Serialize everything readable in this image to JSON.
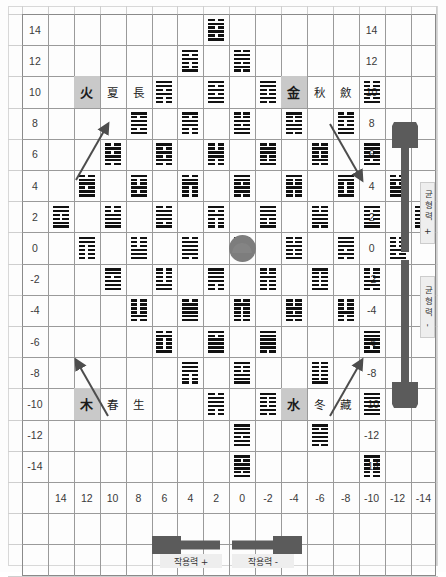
{
  "meta": {
    "center_symbol": "taiji-circle"
  },
  "axes": {
    "y_labels_left": [
      "14",
      "12",
      "10",
      "8",
      "6",
      "4",
      "2",
      "0",
      "-2",
      "-4",
      "-6",
      "-8",
      "-10",
      "-12",
      "-14"
    ],
    "y_labels_right": [
      "14",
      "12",
      "10",
      "8",
      "6",
      "4",
      "2",
      "0",
      "-2",
      "-4",
      "-6",
      "-8",
      "-10",
      "-12",
      "-14"
    ],
    "x_labels": [
      "14",
      "12",
      "10",
      "8",
      "6",
      "4",
      "2",
      "0",
      "-2",
      "-4",
      "-6",
      "-8",
      "-10",
      "-12",
      "-14"
    ],
    "x_axis_title_positive": "작용력 +",
    "x_axis_title_negative": "작용력 -",
    "y_axis_title_positive": "균형력 +",
    "y_axis_title_negative": "균형력 -"
  },
  "elements": [
    {
      "id": "fire",
      "element": "火",
      "season": "夏",
      "phase": "長",
      "row": 2,
      "col": 1,
      "y": 10,
      "x": 12
    },
    {
      "id": "metal",
      "element": "金",
      "season": "秋",
      "phase": "斂",
      "row": 2,
      "col": 9,
      "y": 10,
      "x": -4
    },
    {
      "id": "wood",
      "element": "木",
      "season": "春",
      "phase": "生",
      "row": 12,
      "col": 1,
      "y": -10,
      "x": 12
    },
    {
      "id": "water",
      "element": "水",
      "season": "冬",
      "phase": "藏",
      "row": 12,
      "col": 9,
      "y": -10,
      "x": -4
    }
  ],
  "arrows": {
    "upper_left": {
      "name": "arrow-up-right",
      "label": ""
    },
    "upper_right": {
      "name": "arrow-down-right",
      "label": ""
    },
    "lower_left": {
      "name": "arrow-up-left",
      "label": ""
    },
    "lower_right": {
      "name": "arrow-up-right",
      "label": ""
    }
  },
  "hexagrams": [
    {
      "row": 0,
      "col": 6,
      "lines": "101010"
    },
    {
      "row": 1,
      "col": 5,
      "lines": "100101"
    },
    {
      "row": 1,
      "col": 7,
      "lines": "010110"
    },
    {
      "row": 2,
      "col": 4,
      "lines": "001011"
    },
    {
      "row": 2,
      "col": 6,
      "lines": "110101"
    },
    {
      "row": 2,
      "col": 8,
      "lines": "010011"
    },
    {
      "row": 2,
      "col": 12,
      "lines": "101100"
    },
    {
      "row": 3,
      "col": 3,
      "lines": "101101"
    },
    {
      "row": 3,
      "col": 5,
      "lines": "001101"
    },
    {
      "row": 3,
      "col": 7,
      "lines": "110100"
    },
    {
      "row": 3,
      "col": 9,
      "lines": "011001"
    },
    {
      "row": 3,
      "col": 11,
      "lines": "110010"
    },
    {
      "row": 4,
      "col": 2,
      "lines": "011010"
    },
    {
      "row": 4,
      "col": 4,
      "lines": "010101"
    },
    {
      "row": 4,
      "col": 6,
      "lines": "001100"
    },
    {
      "row": 4,
      "col": 8,
      "lines": "100110"
    },
    {
      "row": 4,
      "col": 10,
      "lines": "010010"
    },
    {
      "row": 4,
      "col": 12,
      "lines": "101011"
    },
    {
      "row": 5,
      "col": 1,
      "lines": "110110"
    },
    {
      "row": 5,
      "col": 3,
      "lines": "101001"
    },
    {
      "row": 5,
      "col": 5,
      "lines": "000110"
    },
    {
      "row": 5,
      "col": 7,
      "lines": "011011"
    },
    {
      "row": 5,
      "col": 9,
      "lines": "001001"
    },
    {
      "row": 5,
      "col": 11,
      "lines": "100011"
    },
    {
      "row": 5,
      "col": 13,
      "lines": "111010"
    },
    {
      "row": 6,
      "col": 0,
      "lines": "110011"
    },
    {
      "row": 6,
      "col": 2,
      "lines": "111100"
    },
    {
      "row": 6,
      "col": 4,
      "lines": "101110"
    },
    {
      "row": 6,
      "col": 6,
      "lines": "000101"
    },
    {
      "row": 6,
      "col": 8,
      "lines": "100111"
    },
    {
      "row": 6,
      "col": 10,
      "lines": "011100"
    },
    {
      "row": 6,
      "col": 12,
      "lines": "110001"
    },
    {
      "row": 6,
      "col": 14,
      "lines": "001010"
    },
    {
      "row": 7,
      "col": 1,
      "lines": "000011"
    },
    {
      "row": 7,
      "col": 3,
      "lines": "111000"
    },
    {
      "row": 7,
      "col": 5,
      "lines": "011110"
    },
    {
      "row": 7,
      "col": 7,
      "lines": "000000"
    },
    {
      "row": 7,
      "col": 9,
      "lines": "100100"
    },
    {
      "row": 7,
      "col": 11,
      "lines": "010111"
    },
    {
      "row": 7,
      "col": 13,
      "lines": "101000"
    },
    {
      "row": 8,
      "col": 2,
      "lines": "111011"
    },
    {
      "row": 8,
      "col": 4,
      "lines": "110000"
    },
    {
      "row": 8,
      "col": 6,
      "lines": "001111"
    },
    {
      "row": 8,
      "col": 8,
      "lines": "000100"
    },
    {
      "row": 8,
      "col": 10,
      "lines": "100001"
    },
    {
      "row": 8,
      "col": 12,
      "lines": "011000"
    },
    {
      "row": 9,
      "col": 3,
      "lines": "010000"
    },
    {
      "row": 9,
      "col": 5,
      "lines": "111110"
    },
    {
      "row": 9,
      "col": 7,
      "lines": "000010"
    },
    {
      "row": 9,
      "col": 9,
      "lines": "010100"
    },
    {
      "row": 9,
      "col": 11,
      "lines": "001000"
    },
    {
      "row": 10,
      "col": 4,
      "lines": "100010"
    },
    {
      "row": 10,
      "col": 6,
      "lines": "111101"
    },
    {
      "row": 10,
      "col": 8,
      "lines": "011111"
    },
    {
      "row": 10,
      "col": 12,
      "lines": "101111"
    },
    {
      "row": 11,
      "col": 5,
      "lines": "000111"
    },
    {
      "row": 11,
      "col": 7,
      "lines": "111001"
    },
    {
      "row": 11,
      "col": 10,
      "lines": "100000"
    },
    {
      "row": 12,
      "col": 6,
      "lines": "001110"
    },
    {
      "row": 12,
      "col": 8,
      "lines": "010001"
    },
    {
      "row": 12,
      "col": 12,
      "lines": "111111"
    },
    {
      "row": 13,
      "col": 7,
      "lines": "110111"
    },
    {
      "row": 13,
      "col": 10,
      "lines": "011101"
    },
    {
      "row": 14,
      "col": 7,
      "lines": "101101"
    },
    {
      "row": 14,
      "col": 12,
      "lines": "000001"
    }
  ]
}
